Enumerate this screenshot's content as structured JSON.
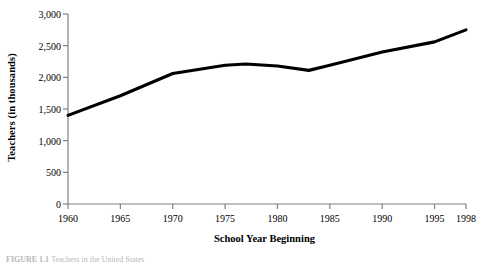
{
  "chart_data": {
    "type": "line",
    "title": "",
    "xlabel": "School Year Beginning",
    "ylabel": "Teachers (in thousands)",
    "xlim": [
      1960,
      1998
    ],
    "ylim": [
      0,
      3000
    ],
    "grid": false,
    "legend": null,
    "line_color": "#000000",
    "axis_color": "#808080",
    "x_ticks": [
      1960,
      1965,
      1970,
      1975,
      1980,
      1985,
      1990,
      1995,
      1998
    ],
    "x_tick_labels": [
      "1960",
      "1965",
      "1970",
      "1975",
      "1980",
      "1985",
      "1990",
      "1995",
      "1998"
    ],
    "y_ticks": [
      0,
      500,
      1000,
      1500,
      2000,
      2500,
      3000
    ],
    "y_tick_labels": [
      "0",
      "500",
      "1,000",
      "1,500",
      "2,000",
      "2,500",
      "3,000"
    ],
    "series": [
      {
        "name": "Teachers",
        "x": [
          1960,
          1965,
          1970,
          1975,
          1977,
          1980,
          1983,
          1985,
          1990,
          1995,
          1998
        ],
        "values": [
          1400,
          1710,
          2060,
          2190,
          2210,
          2180,
          2110,
          2190,
          2400,
          2560,
          2750
        ]
      }
    ]
  },
  "figure": {
    "caption_label": "FIGURE 1.1",
    "caption_body": "Teachers in the United States"
  }
}
